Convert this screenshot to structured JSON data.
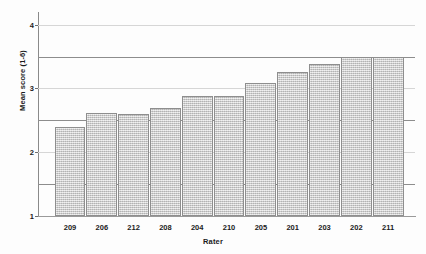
{
  "chart_data": {
    "type": "bar",
    "title": "",
    "xlabel": "Rater",
    "ylabel": "Mean score (1-6)",
    "categories": [
      "209",
      "206",
      "212",
      "208",
      "204",
      "210",
      "205",
      "201",
      "203",
      "202",
      "211"
    ],
    "values": [
      2.4,
      2.62,
      2.6,
      2.7,
      2.88,
      2.88,
      3.08,
      3.25,
      3.38,
      3.5,
      3.5
    ],
    "series": [
      {
        "name": "Mean score",
        "values": [
          2.4,
          2.62,
          2.6,
          2.7,
          2.88,
          2.88,
          3.08,
          3.25,
          3.38,
          3.5,
          3.5
        ]
      }
    ],
    "ylim": [
      1,
      4.15
    ],
    "xlim": [
      0,
      11
    ],
    "y_ticks": [
      1,
      2,
      3,
      4
    ],
    "y_tick_labels": [
      "1",
      "2",
      "3",
      "4"
    ],
    "gridlines": [
      2,
      3,
      4
    ],
    "reference_lines": [
      1.5,
      2.5,
      3.5
    ],
    "grid": true,
    "legend": "none",
    "bar_color": "#c9c9c9",
    "bar_border_color": "#8e8e8e",
    "gridline_color": "#d6d6d6",
    "reference_line_color": "#8d8d8d",
    "axis_color": "#8a8a8a"
  }
}
